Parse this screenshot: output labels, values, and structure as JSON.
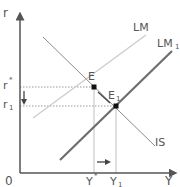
{
  "diagram": {
    "type": "IS-LM",
    "axes": {
      "y_label": "r",
      "x_label": "Y",
      "origin_label": "0"
    },
    "curves": {
      "lm": {
        "label": "LM",
        "color": "#c8c8c8"
      },
      "lm1": {
        "label": "LM",
        "subscript": "1",
        "color": "#6e6e6e"
      },
      "is": {
        "label": "IS",
        "color": "#8a8a8a"
      }
    },
    "points": {
      "e": {
        "label": "E"
      },
      "e1": {
        "label": "E",
        "subscript": "1"
      }
    },
    "y_ticks": {
      "r_star": {
        "label": "r",
        "sup": "*"
      },
      "r1": {
        "label": "r",
        "subscript": "1"
      }
    },
    "x_ticks": {
      "y_star": {
        "label": "Y",
        "sup": "*"
      },
      "y1": {
        "label": "Y",
        "subscript": "1"
      }
    },
    "annotations": {
      "interest_arrow": "down",
      "output_arrow": "right"
    }
  }
}
